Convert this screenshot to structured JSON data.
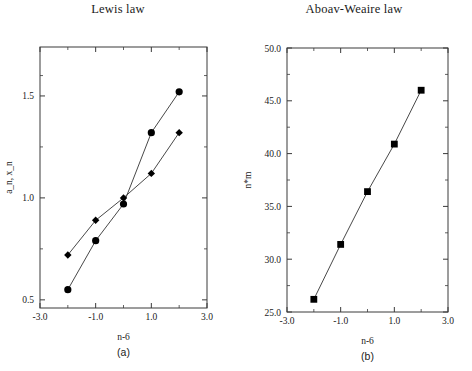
{
  "figure": {
    "background": "#ffffff",
    "ink": "#000000"
  },
  "panels": [
    {
      "key": "lewis",
      "title": "Lewis law",
      "caption": "(a)",
      "xlabel": "n-6",
      "ylabel": "a_n, x_n"
    },
    {
      "key": "aboav",
      "title": "Aboav-Weaire law",
      "caption": "(b)",
      "xlabel": "n-6",
      "ylabel": "n*m"
    }
  ],
  "axes": {
    "lewis": {
      "xticks": [
        "-3.0",
        "-1.0",
        "1.0",
        "3.0"
      ],
      "xtickvals": [
        -3,
        -1,
        1,
        3
      ],
      "yticks": [
        "0.5",
        "1.0",
        "1.5"
      ],
      "ytickvals": [
        0.5,
        1.0,
        1.5
      ],
      "xlim": [
        -3,
        3
      ],
      "ylim": [
        0.46,
        1.74
      ],
      "xminor": [
        -2,
        0,
        2
      ],
      "yminor": [
        0.75,
        1.25,
        1.6
      ]
    },
    "aboav": {
      "xticks": [
        "-3.0",
        "-1.0",
        "1.0",
        "3.0"
      ],
      "xtickvals": [
        -3,
        -1,
        1,
        3
      ],
      "yticks": [
        "25.0",
        "30.0",
        "35.0",
        "40.0",
        "45.0",
        "50.0"
      ],
      "ytickvals": [
        25,
        30,
        35,
        40,
        45,
        50
      ],
      "xlim": [
        -3,
        3
      ],
      "ylim": [
        25,
        50
      ],
      "xminor": [
        -2,
        0,
        2
      ],
      "yminor": [
        27.5,
        32.5,
        37.5,
        42.5,
        47.5
      ]
    }
  },
  "chart_data": [
    {
      "type": "scatter",
      "title": "Lewis law",
      "xlabel": "n-6",
      "ylabel": "a_n, x_n",
      "caption": "(a)",
      "xlim": [
        -3,
        3
      ],
      "ylim": [
        0.46,
        1.74
      ],
      "grid": false,
      "legend": "none",
      "x": [
        -2,
        -1,
        0,
        1,
        2
      ],
      "series": [
        {
          "name": "a_n",
          "marker": "circle",
          "values": [
            0.55,
            0.79,
            0.97,
            1.32,
            1.52
          ],
          "line": true
        },
        {
          "name": "x_n",
          "marker": "diamond",
          "values": [
            0.72,
            0.89,
            1.0,
            1.12,
            1.32
          ],
          "line": true
        }
      ]
    },
    {
      "type": "scatter",
      "title": "Aboav-Weaire law",
      "xlabel": "n-6",
      "ylabel": "n*m",
      "caption": "(b)",
      "xlim": [
        -3,
        3
      ],
      "ylim": [
        25,
        50
      ],
      "grid": false,
      "legend": "none",
      "x": [
        -2,
        -1,
        0,
        1,
        2
      ],
      "series": [
        {
          "name": "n*m",
          "marker": "square",
          "values": [
            26.2,
            31.4,
            36.4,
            40.9,
            46.0
          ],
          "line": true
        }
      ]
    }
  ]
}
